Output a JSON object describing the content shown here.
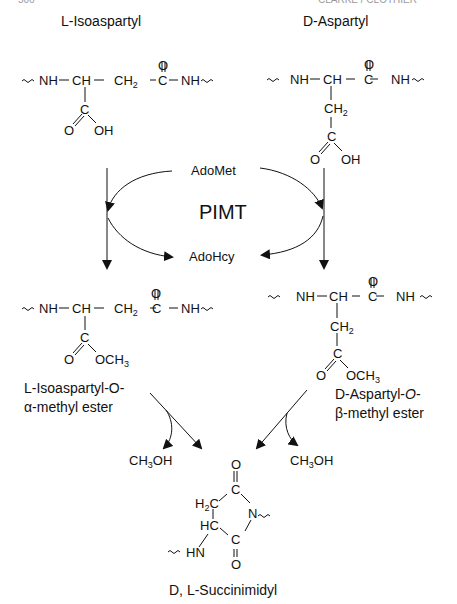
{
  "header": {
    "left_fragment": "506",
    "right_fragment": "CLARKE / CLOTHIER"
  },
  "compounds": {
    "l_isoaspartyl": {
      "name": "L-Isoaspartyl",
      "backbone": [
        "NH",
        "CH",
        "CH",
        "C",
        "NH"
      ],
      "ch2_sub": "2",
      "carbonyl_o": "O",
      "side_c": "C",
      "side_o": "O",
      "side_oh": "OH"
    },
    "d_aspartyl": {
      "name": "D-Aspartyl",
      "backbone": [
        "NH",
        "CH",
        "C",
        "NH"
      ],
      "side_ch": "CH",
      "ch2_sub": "2",
      "carbonyl_o": "O",
      "side_c": "C",
      "side_o": "O",
      "side_oh": "OH"
    },
    "l_isoaspartyl_ester": {
      "name_line1": "L-Isoaspartyl-O-",
      "name_line2": "α-methyl ester",
      "backbone": [
        "NH",
        "CH",
        "CH",
        "C",
        "NH"
      ],
      "ch2_sub": "2",
      "carbonyl_o": "O",
      "side_c": "C",
      "side_o": "O",
      "side_och": "OCH",
      "och_sub": "3"
    },
    "d_aspartyl_ester": {
      "name_line1": "D-Aspartyl-",
      "name_line1_italic": "O",
      "name_line1_end": "-",
      "name_line2": "β-methyl ester",
      "backbone": [
        "NH",
        "CH",
        "C",
        "NH"
      ],
      "side_ch": "CH",
      "ch2_sub": "2",
      "carbonyl_o": "O",
      "side_c": "C",
      "side_o": "O",
      "side_och": "OCH",
      "och_sub": "3"
    },
    "succinimidyl": {
      "name": "D, L-Succinimidyl",
      "atoms": {
        "o_top": "O",
        "c_top": "C",
        "h2c": "H",
        "h2c_sub": "2",
        "h2c_c": "C",
        "n": "N",
        "hc": "HC",
        "c_bot": "C",
        "o_bot": "O",
        "hn": "HN"
      }
    }
  },
  "enzyme": {
    "name": "PIMT",
    "cofactor_in": "AdoMet",
    "cofactor_out": "AdoHcy"
  },
  "byproducts": {
    "left": {
      "main": "CH",
      "sub": "3",
      "end": "OH"
    },
    "right": {
      "main": "CH",
      "sub": "3",
      "end": "OH"
    }
  }
}
